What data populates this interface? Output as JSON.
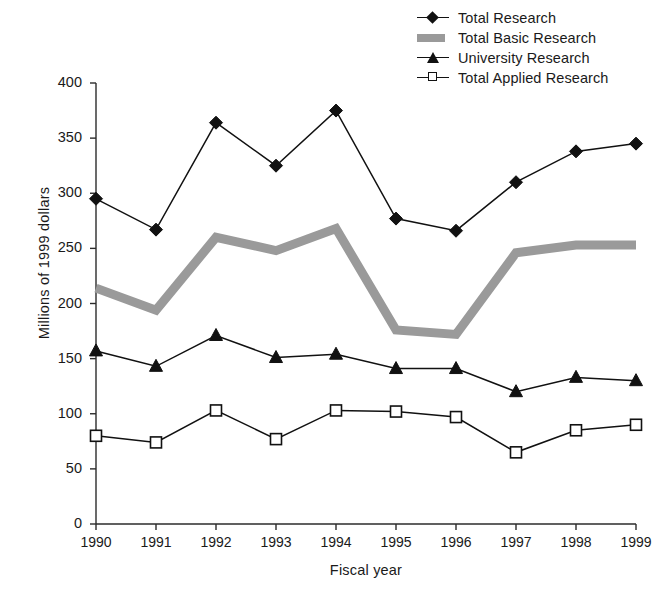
{
  "chart_data": {
    "type": "line",
    "title": "",
    "xlabel": "Fiscal year",
    "ylabel": "Millions of 1999 dollars",
    "categories": [
      "1990",
      "1991",
      "1992",
      "1993",
      "1994",
      "1995",
      "1996",
      "1997",
      "1998",
      "1999"
    ],
    "x": [
      1990,
      1991,
      1992,
      1993,
      1994,
      1995,
      1996,
      1997,
      1998,
      1999
    ],
    "xlim": [
      1990,
      1999
    ],
    "ylim": [
      0,
      400
    ],
    "yticks": [
      0,
      50,
      100,
      150,
      200,
      250,
      300,
      350,
      400
    ],
    "ytick_labels": [
      "0",
      "50",
      "100",
      "150",
      "200",
      "250",
      "300",
      "350",
      "400"
    ],
    "grid": false,
    "legend_position": "top-right",
    "series": [
      {
        "name": "Total Research",
        "marker": "diamond",
        "marker_fill": "#111111",
        "line_color": "#111111",
        "values": [
          295,
          267,
          364,
          325,
          375,
          277,
          266,
          310,
          338,
          345
        ]
      },
      {
        "name": "Total Basic Research",
        "marker": "none",
        "marker_fill": "#9a9a9a",
        "line_color": "#9a9a9a",
        "values": [
          214,
          194,
          260,
          248,
          268,
          176,
          172,
          246,
          253,
          253
        ]
      },
      {
        "name": "University Research",
        "marker": "triangle",
        "marker_fill": "#111111",
        "line_color": "#111111",
        "values": [
          157,
          143,
          171,
          151,
          154,
          141,
          141,
          120,
          133,
          130
        ]
      },
      {
        "name": "Total Applied Research",
        "marker": "square",
        "marker_fill": "#ffffff",
        "line_color": "#111111",
        "values": [
          80,
          74,
          103,
          77,
          103,
          102,
          97,
          65,
          85,
          90
        ]
      }
    ]
  },
  "legend": {
    "items": [
      {
        "label": "Total Research",
        "key": "line-diamond-key"
      },
      {
        "label": "Total Basic Research",
        "key": "gray-band-key"
      },
      {
        "label": "University Research",
        "key": "line-triangle-key"
      },
      {
        "label": "Total Applied Research",
        "key": "line-square-key"
      }
    ]
  },
  "axes": {
    "y_title": "Millions of 1999 dollars",
    "x_title": "Fiscal year"
  },
  "caption": {
    "text": ""
  }
}
